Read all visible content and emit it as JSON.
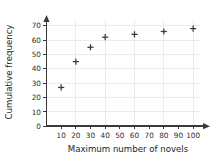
{
  "chart_data": {
    "type": "scatter",
    "title": "",
    "xlabel": "Maximum number of novels",
    "ylabel": "Cumulative frequency",
    "x": [
      10,
      20,
      30,
      40,
      60,
      80,
      100
    ],
    "values": [
      27,
      45,
      55,
      62,
      64,
      66,
      68
    ],
    "points": [
      {
        "x": 10,
        "y": 27
      },
      {
        "x": 20,
        "y": 45
      },
      {
        "x": 30,
        "y": 55
      },
      {
        "x": 40,
        "y": 62
      },
      {
        "x": 60,
        "y": 64
      },
      {
        "x": 80,
        "y": 66
      },
      {
        "x": 100,
        "y": 68
      }
    ],
    "xlim": [
      0,
      105
    ],
    "ylim": [
      0,
      74
    ],
    "xticks": [
      10,
      20,
      30,
      40,
      50,
      60,
      70,
      80,
      90,
      100
    ],
    "yticks": [
      0,
      10,
      20,
      30,
      40,
      50,
      60,
      70
    ],
    "xtick_labels": [
      "10",
      "20",
      "30",
      "40",
      "50",
      "60",
      "70",
      "80",
      "90",
      "100"
    ],
    "ytick_labels": [
      "0",
      "10",
      "20",
      "30",
      "40",
      "50",
      "60",
      "70"
    ],
    "grid": true,
    "grid_x_step": 20,
    "grid_y_step": 10,
    "legend": null,
    "marker": "plus",
    "marker_color": "#3b3b3b",
    "grid_color": "#e4e4e6",
    "axis_color": "#3a3a3a",
    "background_color": "#ffffff"
  }
}
